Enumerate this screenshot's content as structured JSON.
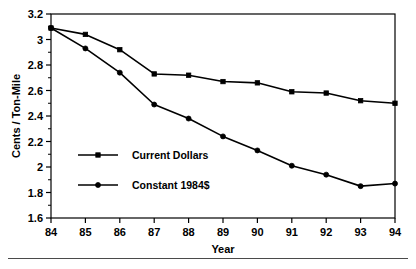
{
  "chart_data": {
    "type": "line",
    "title": "",
    "subtitle": "",
    "xlabel": "Year",
    "ylabel": "Cents / Ton-Mile",
    "categories": [
      "84",
      "85",
      "86",
      "87",
      "88",
      "89",
      "90",
      "91",
      "92",
      "93",
      "94"
    ],
    "x": [
      84,
      85,
      86,
      87,
      88,
      89,
      90,
      91,
      92,
      93,
      94
    ],
    "xlim": [
      84,
      94
    ],
    "ylim": [
      1.6,
      3.2
    ],
    "ytick_labels": [
      "1.6",
      "1.8",
      "2",
      "2.2",
      "2.4",
      "2.6",
      "2.8",
      "3",
      "3.2"
    ],
    "yticks": [
      1.6,
      1.8,
      2.0,
      2.2,
      2.4,
      2.6,
      2.8,
      3.0,
      3.2
    ],
    "xtick_labels": [
      "84",
      "85",
      "86",
      "87",
      "88",
      "89",
      "90",
      "91",
      "92",
      "93",
      "94"
    ],
    "grid": false,
    "legend_position": "inside-left",
    "series": [
      {
        "name": "Current Dollars",
        "marker": "square",
        "color": "#000000",
        "values": [
          3.09,
          3.04,
          2.92,
          2.73,
          2.72,
          2.67,
          2.66,
          2.59,
          2.58,
          2.52,
          2.5
        ]
      },
      {
        "name": "Constant 1984$",
        "marker": "circle",
        "color": "#000000",
        "values": [
          3.09,
          2.93,
          2.74,
          2.49,
          2.38,
          2.24,
          2.13,
          2.01,
          1.94,
          1.85,
          1.87
        ]
      }
    ],
    "legend": [
      {
        "label": "Current Dollars",
        "marker": "square"
      },
      {
        "label": "Constant 1984$",
        "marker": "circle"
      }
    ]
  },
  "axes": {
    "y_title": "Cents / Ton-Mile",
    "x_title": "Year"
  }
}
